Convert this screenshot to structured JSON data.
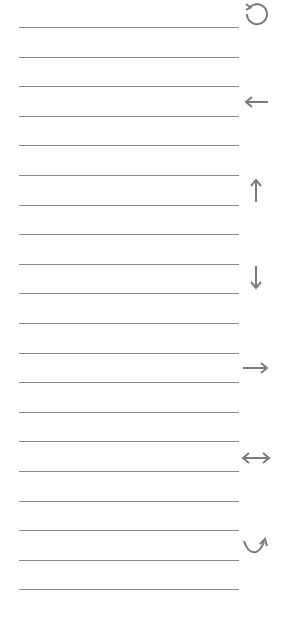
{
  "colors": {
    "line": "#8a8a8a",
    "icon": "#7a7a7a",
    "background": "#ffffff"
  },
  "lines": {
    "count": 20,
    "start_y": 27,
    "spacing": 29.6
  },
  "icons": [
    {
      "name": "rotate-ccw-icon",
      "y": 0
    },
    {
      "name": "arrow-left-icon",
      "y": 88
    },
    {
      "name": "arrow-up-icon",
      "y": 176
    },
    {
      "name": "arrow-down-icon",
      "y": 266
    },
    {
      "name": "arrow-right-icon",
      "y": 354
    },
    {
      "name": "arrow-left-right-icon",
      "y": 444
    },
    {
      "name": "curved-arrow-up-right-icon",
      "y": 530
    }
  ]
}
